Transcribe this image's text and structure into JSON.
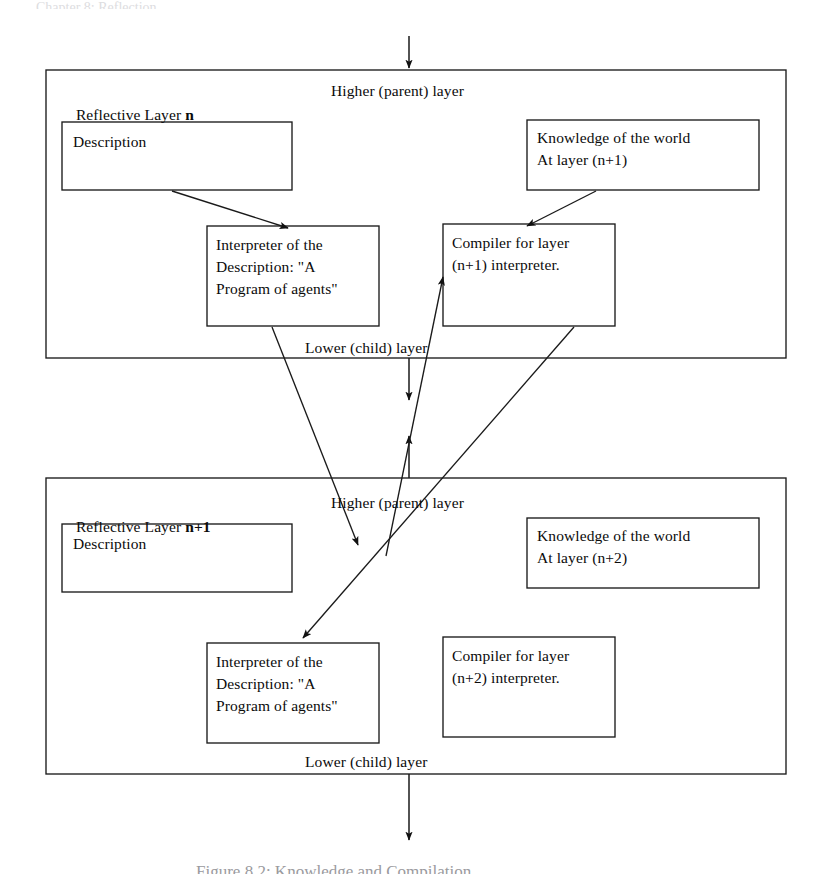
{
  "figure": {
    "page_header_fragment": "Chapter 8: Reflection",
    "caption_fragment": "Figure 8.2: Knowledge and Compilation"
  },
  "layers": [
    {
      "id": "layer-n",
      "title_prefix": "Reflective Layer ",
      "title_emphasis": "n",
      "top_label": "Higher (parent) layer",
      "bottom_label": "Lower (child) layer",
      "boxes": {
        "description": {
          "lines": [
            "Description"
          ]
        },
        "knowledge": {
          "lines": [
            "Knowledge of the world",
            "At layer (n+1)"
          ]
        },
        "interpreter": {
          "lines": [
            "Interpreter of the",
            "Description: \"A",
            "Program of agents\""
          ]
        },
        "compiler": {
          "lines": [
            "Compiler for layer",
            "(n+1) interpreter."
          ]
        }
      }
    },
    {
      "id": "layer-n-plus-1",
      "title_prefix": "Reflective Layer ",
      "title_emphasis": "n+1",
      "top_label": "Higher (parent) layer",
      "bottom_label": "Lower (child) layer",
      "boxes": {
        "description": {
          "lines": [
            "Description"
          ]
        },
        "knowledge": {
          "lines": [
            "Knowledge of the world",
            "At layer (n+2)"
          ]
        },
        "interpreter": {
          "lines": [
            "Interpreter of the",
            "Description: \"A",
            "Program of agents\""
          ]
        },
        "compiler": {
          "lines": [
            "Compiler for layer",
            "(n+2) interpreter."
          ]
        }
      }
    }
  ],
  "colors": {
    "ink": "#0b0b0b",
    "stroke": "#1a1a1a",
    "page": "#ffffff"
  }
}
